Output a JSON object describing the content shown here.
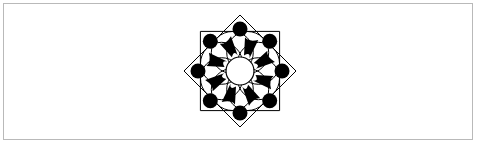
{
  "figure": {
    "colors": {
      "stroke": "#000000",
      "fill": "#000000",
      "background": "#ffffff",
      "frame": "#b9b9b9"
    },
    "star": {
      "center": [
        240,
        71
      ],
      "tip_radius": 56,
      "points": 8
    },
    "dots": {
      "count": 8,
      "radius": 7.5,
      "ring_radius": 42
    },
    "center_circle": {
      "radius": 14
    }
  }
}
